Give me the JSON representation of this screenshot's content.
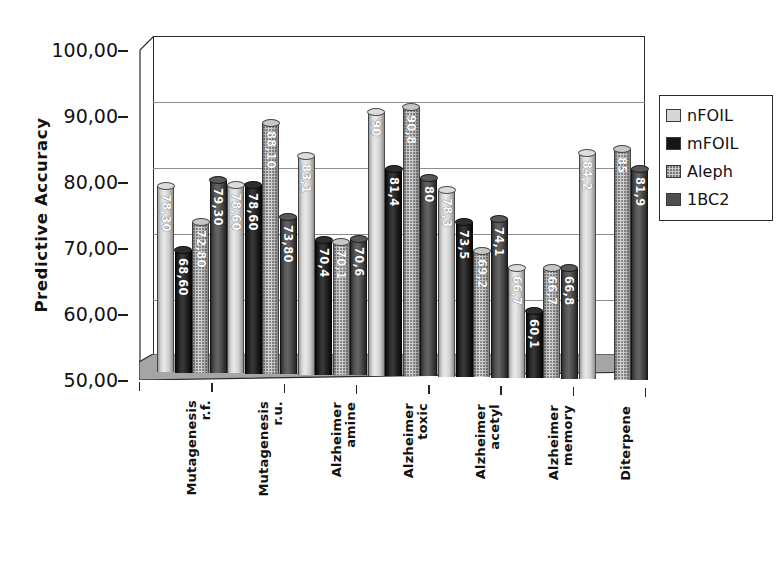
{
  "chart_data": {
    "type": "bar",
    "title": "",
    "xlabel": "",
    "ylabel": "Predictive  Accuracy",
    "ylim": [
      50,
      100
    ],
    "ytick_step": 10,
    "ytick_labels": [
      "100,00",
      "90,00",
      "80,00",
      "70,00",
      "60,00",
      "50,00"
    ],
    "ytick_values": [
      100,
      90,
      80,
      70,
      60,
      50
    ],
    "grid": true,
    "legend_position": "right",
    "categories": [
      "Mutagenesis r.f.",
      "Mutagenesis r.u.",
      "Alzheimer amine",
      "Alzheimer toxic",
      "Alzheimer acetyl",
      "Alzheimer memory",
      "Diterpene"
    ],
    "category_lines": [
      [
        "Mutagenesis",
        "r.f."
      ],
      [
        "Mutagenesis",
        "r.u."
      ],
      [
        "Alzheimer",
        "amine"
      ],
      [
        "Alzheimer",
        "toxic"
      ],
      [
        "Alzheimer",
        "acetyl"
      ],
      [
        "Alzheimer",
        "memory"
      ],
      [
        "Diterpene",
        ""
      ]
    ],
    "series": [
      {
        "name": "nFOIL",
        "key": "nfoil",
        "values": [
          78.3,
          78.6,
          83.1,
          90,
          78.3,
          66.7,
          84.2
        ],
        "labels": [
          "78,30",
          "78,60",
          "83,1",
          "90",
          "78,3",
          "66,7",
          "84,2"
        ]
      },
      {
        "name": "mFOIL",
        "key": "mfoil",
        "values": [
          68.6,
          78.6,
          70.4,
          81.4,
          73.5,
          60.1,
          null
        ],
        "labels": [
          "68,60",
          "78,60",
          "70,4",
          "81,4",
          "73,5",
          "60,1",
          ""
        ]
      },
      {
        "name": "Aleph",
        "key": "aleph",
        "values": [
          72.8,
          88.1,
          70.1,
          90.8,
          69.2,
          66.7,
          85
        ],
        "labels": [
          "72,80",
          "88,10",
          "70,1",
          "90,8",
          "69,2",
          "66,7",
          "85"
        ]
      },
      {
        "name": "1BC2",
        "key": "1bc2",
        "values": [
          79.3,
          73.8,
          70.6,
          80,
          74.1,
          66.8,
          81.9
        ],
        "labels": [
          "79,30",
          "73,80",
          "70,6",
          "80",
          "74,1",
          "66,8",
          "81,9"
        ]
      }
    ]
  },
  "legend": {
    "items": [
      {
        "label": "nFOIL",
        "swatch": "nfoil"
      },
      {
        "label": "mFOIL",
        "swatch": "mfoil"
      },
      {
        "label": "Aleph",
        "swatch": "aleph"
      },
      {
        "label": "1BC2",
        "swatch": "bc2"
      }
    ]
  },
  "colors": {
    "nFOIL": "#d7d7d7",
    "mFOIL": "#151515",
    "Aleph": "#c9c9c9",
    "1BC2": "#4f4f4f",
    "axis": "#2a2a2a",
    "gridline": "#8d8d8d",
    "floor": "#9a9a9a",
    "text": "#111111"
  }
}
